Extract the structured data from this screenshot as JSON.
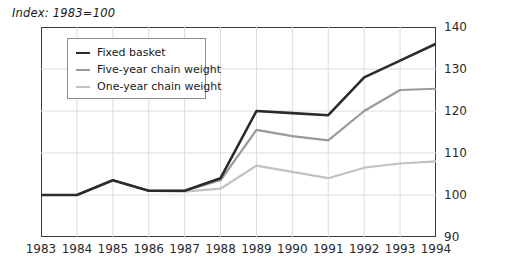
{
  "chart_data": {
    "type": "line",
    "title": "Index: 1983=100",
    "xlabel": "",
    "ylabel": "",
    "grid": true,
    "legend_position": "top-left-inside",
    "xlim": [
      1983,
      1994
    ],
    "ylim": [
      90,
      140
    ],
    "ytick_step": 10,
    "categories": [
      1983,
      1984,
      1985,
      1986,
      1987,
      1988,
      1989,
      1990,
      1991,
      1992,
      1993,
      1994
    ],
    "xtick_labels": [
      "1983",
      "1984",
      "1985",
      "1986",
      "1987",
      "1988",
      "1989",
      "1990",
      "1991",
      "1992",
      "1993",
      "1994"
    ],
    "ytick_labels": [
      "90",
      "100",
      "110",
      "120",
      "130",
      "140"
    ],
    "ytick_values": [
      90,
      100,
      110,
      120,
      130,
      140
    ],
    "series": [
      {
        "name": "Fixed basket",
        "color": "#2b2b2b",
        "width": 2.6,
        "values": [
          100,
          100,
          103.5,
          101,
          101,
          104,
          120,
          119.5,
          119,
          128,
          132,
          136
        ]
      },
      {
        "name": "Five-year chain weight",
        "color": "#9a9a9a",
        "width": 2.2,
        "values": [
          100,
          100,
          103.5,
          101,
          101,
          103.5,
          115.5,
          114,
          113,
          120,
          125,
          125.3
        ]
      },
      {
        "name": "One-year chain weight",
        "color": "#c2c2c2",
        "width": 2.2,
        "values": [
          100,
          100,
          103.5,
          101,
          100.8,
          101.5,
          107,
          105.5,
          104,
          106.5,
          107.5,
          108
        ]
      }
    ]
  },
  "legend": {
    "items": [
      {
        "label": "Fixed basket"
      },
      {
        "label": "Five-year chain weight"
      },
      {
        "label": "One-year chain weight"
      }
    ]
  },
  "colors": {
    "fixed_basket": "#2b2b2b",
    "five_year": "#9a9a9a",
    "one_year": "#c2c2c2",
    "axis": "#3a3a3a",
    "grid": "#dddddd",
    "text": "#1a1a1a",
    "background": "#ffffff"
  }
}
